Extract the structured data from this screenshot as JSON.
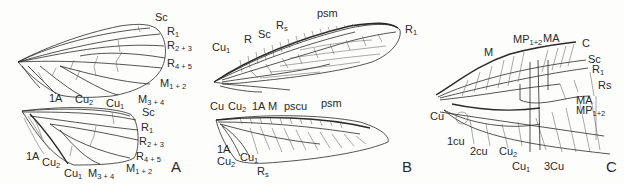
{
  "figure": {
    "panels": [
      {
        "id": "A",
        "label": "A",
        "forewing_labels": [
          "Sc",
          "R1",
          "R2 + 3",
          "R4 + 5",
          "M1 + 2",
          "M3 + 4",
          "Cu1",
          "Cu2",
          "1A"
        ],
        "hindwing_labels": [
          "Sc",
          "R1",
          "R2 + 3",
          "R4 + 5",
          "M1 + 2",
          "M3 + 4",
          "Cu1",
          "Cu2",
          "1A"
        ]
      },
      {
        "id": "B",
        "label": "B",
        "forewing_labels": [
          "psm",
          "R1",
          "Rs",
          "Sc",
          "R",
          "Cu1",
          "Cu",
          "Cu2",
          "1A",
          "M",
          "pscu"
        ],
        "hindwing_labels": [
          "psm",
          "1A",
          "Cu2",
          "Cu1",
          "Rs"
        ]
      },
      {
        "id": "C",
        "label": "C",
        "wing_labels": [
          "M",
          "MP1+2",
          "MA",
          "C",
          "Sc",
          "R1",
          "Rs",
          "MA",
          "MP1+2",
          "Cu",
          "1cu",
          "2cu",
          "Cu2",
          "Cu1",
          "3Cu",
          "C"
        ]
      }
    ]
  },
  "labels": {
    "a": {
      "fw_sc": {
        "base": "Sc",
        "sub": ""
      },
      "fw_r1": {
        "base": "R",
        "sub": "1"
      },
      "fw_r23": {
        "base": "R",
        "sub": "2 + 3"
      },
      "fw_r45": {
        "base": "R",
        "sub": "4 + 5"
      },
      "fw_m12": {
        "base": "M",
        "sub": "1 + 2"
      },
      "fw_m34": {
        "base": "M",
        "sub": "3 + 4"
      },
      "fw_cu1": {
        "base": "Cu",
        "sub": "1"
      },
      "fw_cu2": {
        "base": "Cu",
        "sub": "2"
      },
      "fw_1a": {
        "base": "1A",
        "sub": ""
      },
      "hw_sc": {
        "base": "Sc",
        "sub": ""
      },
      "hw_r1": {
        "base": "R",
        "sub": "1"
      },
      "hw_r23": {
        "base": "R",
        "sub": "2 + 3"
      },
      "hw_r45": {
        "base": "R",
        "sub": "4 + 5"
      },
      "hw_m12": {
        "base": "M",
        "sub": "1 + 2"
      },
      "hw_m34": {
        "base": "M",
        "sub": "3 + 4"
      },
      "hw_cu1": {
        "base": "Cu",
        "sub": "1"
      },
      "hw_cu2": {
        "base": "Cu",
        "sub": "2"
      },
      "hw_1a": {
        "base": "1A",
        "sub": ""
      },
      "panel": "A"
    },
    "b": {
      "psm_top": {
        "base": "psm",
        "sub": ""
      },
      "r1": {
        "base": "R",
        "sub": "1"
      },
      "rs_top": {
        "base": "R",
        "sub": "s"
      },
      "sc": {
        "base": "Sc",
        "sub": ""
      },
      "r": {
        "base": "R",
        "sub": ""
      },
      "cu1_top": {
        "base": "Cu",
        "sub": "1"
      },
      "cu": {
        "base": "Cu",
        "sub": ""
      },
      "cu2_top": {
        "base": "Cu",
        "sub": "2"
      },
      "a1_top": {
        "base": "1A",
        "sub": ""
      },
      "m": {
        "base": "M",
        "sub": ""
      },
      "pscu": {
        "base": "pscu",
        "sub": ""
      },
      "psm_bot": {
        "base": "psm",
        "sub": ""
      },
      "a1_bot": {
        "base": "1A",
        "sub": ""
      },
      "cu2_bot": {
        "base": "Cu",
        "sub": "2"
      },
      "cu1_bot": {
        "base": "Cu",
        "sub": "1"
      },
      "rs_bot": {
        "base": "R",
        "sub": "s"
      },
      "panel": "B"
    },
    "c": {
      "m": {
        "base": "M",
        "sub": ""
      },
      "mp12_top": {
        "base": "MP",
        "sub": "1+2"
      },
      "ma_top": {
        "base": "MA",
        "sub": ""
      },
      "c_top": {
        "base": "C",
        "sub": ""
      },
      "sc": {
        "base": "Sc",
        "sub": ""
      },
      "r1": {
        "base": "R",
        "sub": "1"
      },
      "rs": {
        "base": "Rs",
        "sub": ""
      },
      "ma_right": {
        "base": "MA",
        "sub": ""
      },
      "mp12_right": {
        "base": "MP",
        "sub": "1+2"
      },
      "cu": {
        "base": "Cu",
        "sub": ""
      },
      "cu_1": {
        "base": "1cu",
        "sub": ""
      },
      "cu_2": {
        "base": "2cu",
        "sub": ""
      },
      "cu2": {
        "base": "Cu",
        "sub": "2"
      },
      "cu1": {
        "base": "Cu",
        "sub": "1"
      },
      "cu3": {
        "base": "3Cu",
        "sub": ""
      },
      "c_bot": {
        "base": "C",
        "sub": ""
      },
      "panel": "C"
    }
  }
}
